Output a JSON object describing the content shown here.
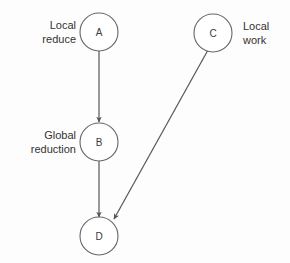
{
  "diagram": {
    "type": "directed-graph",
    "background_color": "#fdfdfd",
    "stroke_color": "#555555",
    "text_color": "#333333",
    "nodes": [
      {
        "id": "A",
        "label": "A",
        "cx": 99,
        "cy": 32,
        "r": 19
      },
      {
        "id": "B",
        "label": "B",
        "cx": 99,
        "cy": 142,
        "r": 19
      },
      {
        "id": "C",
        "label": "C",
        "cx": 213,
        "cy": 33,
        "r": 19
      },
      {
        "id": "D",
        "label": "D",
        "cx": 99,
        "cy": 236,
        "r": 19
      }
    ],
    "edges": [
      {
        "from": "A",
        "to": "B",
        "x1": 99,
        "y1": 51,
        "x2": 99,
        "y2": 122
      },
      {
        "from": "B",
        "to": "D",
        "x1": 99,
        "y1": 161,
        "x2": 99,
        "y2": 217
      },
      {
        "from": "C",
        "to": "D",
        "x1": 208,
        "y1": 50,
        "x2": 114,
        "y2": 219
      }
    ],
    "annotations": [
      {
        "id": "local-reduce",
        "lines": [
          "Local",
          "reduce"
        ],
        "target": "A",
        "align": "right"
      },
      {
        "id": "global-reduction",
        "lines": [
          "Global",
          "reduction"
        ],
        "target": "B",
        "align": "right"
      },
      {
        "id": "local-work",
        "lines": [
          "Local",
          "work"
        ],
        "target": "C",
        "align": "left"
      }
    ]
  }
}
